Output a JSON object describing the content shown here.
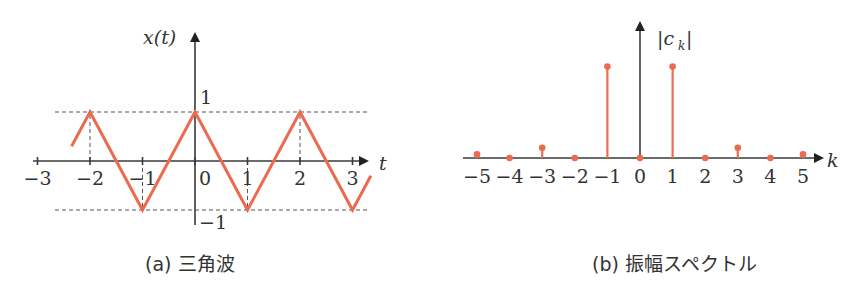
{
  "chart_data": [
    {
      "type": "line",
      "title": "(a) 三角波",
      "caption": "(a) 三角波",
      "xlabel": "t",
      "ylabel": "x(t)",
      "xlim": [
        -3,
        3.5
      ],
      "ylim": [
        -1,
        1
      ],
      "x_ticks": [
        -3,
        -2,
        -1,
        0,
        1,
        2,
        3
      ],
      "x_tick_labels": [
        "−3",
        "−2",
        "−1",
        "0",
        "1",
        "2",
        "3"
      ],
      "y_tick_labels": {
        "top": "1",
        "bottom": "−1"
      },
      "series": [
        {
          "name": "x(t)",
          "color": "#ec6a50",
          "x": [
            -2.35,
            -2,
            -1,
            0,
            1,
            2,
            3,
            3.35
          ],
          "y": [
            0.3,
            1,
            -1,
            1,
            -1,
            1,
            -1,
            -0.3
          ]
        }
      ],
      "guides": {
        "horizontal_dashed_at_y": [
          1,
          -1
        ],
        "vertical_dashed_at_x": [
          -2,
          -1,
          1,
          2
        ]
      }
    },
    {
      "type": "stem",
      "title": "(b) 振幅スペクトル",
      "caption": "(b) 振幅スペクトル",
      "xlabel": "k",
      "ylabel": "|c_k|",
      "ylabel_main": "|c",
      "ylabel_sub": "k",
      "x_ticks": [
        -5,
        -4,
        -3,
        -2,
        -1,
        0,
        1,
        2,
        3,
        4,
        5
      ],
      "x_tick_labels": [
        "−5",
        "−4",
        "−3",
        "−2",
        "−1",
        "0",
        "1",
        "2",
        "3",
        "4",
        "5"
      ],
      "categories": [
        -5,
        -4,
        -3,
        -2,
        -1,
        0,
        1,
        2,
        3,
        4,
        5
      ],
      "values": [
        0.032,
        0,
        0.09,
        0,
        0.81,
        0,
        0.81,
        0,
        0.09,
        0,
        0.032
      ],
      "ylim": [
        0,
        1
      ],
      "color": "#ec6a50"
    }
  ]
}
